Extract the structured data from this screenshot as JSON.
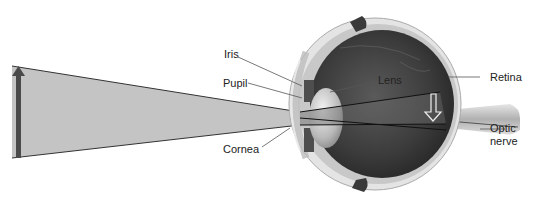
{
  "diagram": {
    "labels": {
      "iris": "Iris",
      "pupil": "Pupil",
      "cornea": "Cornea",
      "lens": "Lens",
      "retina": "Retina",
      "optic_nerve_line1": "Optic",
      "optic_nerve_line2": "nerve"
    },
    "elements": {
      "object_arrow": "upright-arrow",
      "image_arrow": "inverted-arrow",
      "light_cone": "converging-light-rays"
    },
    "colors": {
      "light_cone_fill": "#c4c4c4",
      "object_arrow": "#4a4a4a",
      "eye_interior": "#3a3a3a",
      "sclera": "#d8d8d8",
      "leader_line": "#555555",
      "text": "#222222"
    }
  }
}
